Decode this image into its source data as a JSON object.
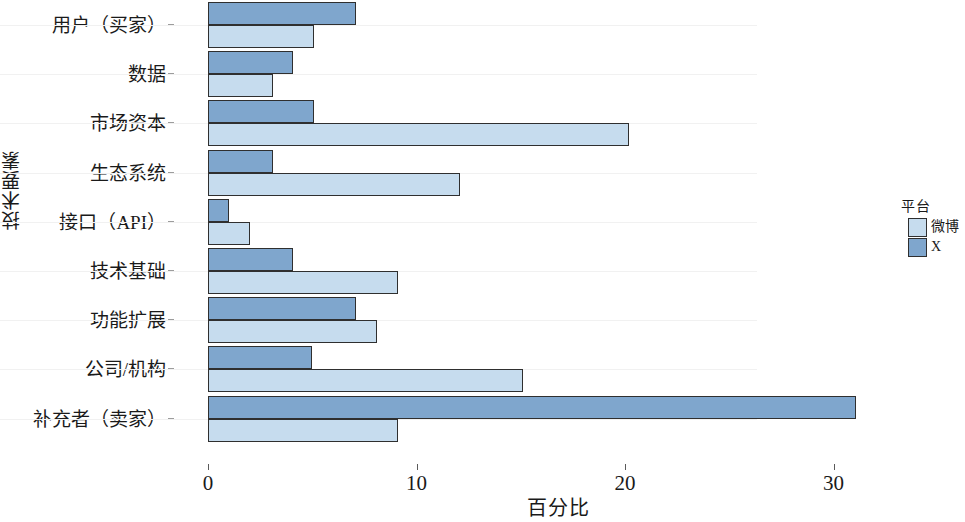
{
  "chart_data": {
    "type": "bar",
    "orientation": "horizontal",
    "title": "",
    "xlabel": "百分比",
    "ylabel": "技术要素",
    "xlim": [
      0,
      33
    ],
    "xticks": [
      0,
      10,
      20,
      30
    ],
    "xticklabels": [
      "0",
      "10",
      "20",
      "30"
    ],
    "grid": true,
    "legend": {
      "title": "平台",
      "position": "right",
      "entries": [
        {
          "name": "微博",
          "color": "#c6dcee"
        },
        {
          "name": "X",
          "color": "#7fa6cd"
        }
      ]
    },
    "categories": [
      "用户（买家）",
      "数据",
      "市场资本",
      "生态系统",
      "接口（API）",
      "技术基础",
      "功能扩展",
      "公司/机构",
      "补充者（卖家）"
    ],
    "series": [
      {
        "name": "X",
        "color": "#7fa6cd",
        "values": [
          7.1,
          4.1,
          5.1,
          3.1,
          1.0,
          4.1,
          7.1,
          5.0,
          31.1
        ]
      },
      {
        "name": "微博",
        "color": "#c6dcee",
        "values": [
          5.1,
          3.1,
          20.2,
          12.1,
          2.0,
          9.1,
          8.1,
          15.1,
          9.1
        ]
      }
    ]
  }
}
